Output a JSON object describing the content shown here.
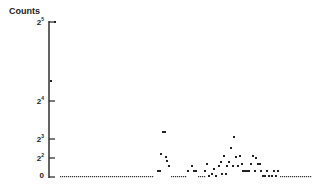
{
  "chart_data": {
    "type": "scatter",
    "title": "",
    "xlabel": "",
    "ylabel": "Counts",
    "yscale": "log2-like (0, 2^2, 2^3, 2^4, 2^5)",
    "ylim": [
      0,
      32
    ],
    "yticks": [
      {
        "label": "0",
        "base": "0",
        "exp": "",
        "value": 0,
        "py": 177
      },
      {
        "label": "2^2",
        "base": "2",
        "exp": "2",
        "value": 4,
        "py": 158
      },
      {
        "label": "2^3",
        "base": "2",
        "exp": "3",
        "value": 8,
        "py": 139
      },
      {
        "label": "2^4",
        "base": "2",
        "exp": "4",
        "value": 16,
        "py": 101
      },
      {
        "label": "2^5",
        "base": "2",
        "exp": "5",
        "value": 32,
        "py": 22
      }
    ],
    "grid": false,
    "legend": null,
    "points_px": [
      [
        55,
        22
      ],
      [
        51,
        81
      ],
      [
        158,
        171
      ],
      [
        160,
        171
      ],
      [
        161,
        154
      ],
      [
        163,
        132
      ],
      [
        165,
        132
      ],
      [
        166,
        157
      ],
      [
        167,
        161
      ],
      [
        169,
        166
      ],
      [
        188,
        171
      ],
      [
        192,
        166
      ],
      [
        194,
        171
      ],
      [
        196,
        171
      ],
      [
        205,
        171
      ],
      [
        207,
        164
      ],
      [
        209,
        176
      ],
      [
        212,
        174
      ],
      [
        214,
        169
      ],
      [
        216,
        176
      ],
      [
        219,
        166
      ],
      [
        221,
        162
      ],
      [
        222,
        174
      ],
      [
        224,
        156
      ],
      [
        226,
        174
      ],
      [
        227,
        166
      ],
      [
        229,
        162
      ],
      [
        231,
        148
      ],
      [
        233,
        166
      ],
      [
        234,
        137
      ],
      [
        236,
        157
      ],
      [
        238,
        166
      ],
      [
        240,
        156
      ],
      [
        242,
        164
      ],
      [
        243,
        171
      ],
      [
        245,
        171
      ],
      [
        247,
        171
      ],
      [
        249,
        171
      ],
      [
        251,
        164
      ],
      [
        253,
        156
      ],
      [
        255,
        171
      ],
      [
        256,
        158
      ],
      [
        258,
        164
      ],
      [
        260,
        164
      ],
      [
        261,
        171
      ],
      [
        263,
        176
      ],
      [
        265,
        176
      ],
      [
        267,
        171
      ],
      [
        269,
        176
      ],
      [
        272,
        176
      ],
      [
        274,
        171
      ],
      [
        276,
        176
      ],
      [
        278,
        171
      ]
    ],
    "zero_runs": [
      {
        "x_start": 60,
        "x_end": 153,
        "py": 177
      },
      {
        "x_start": 171,
        "x_end": 186,
        "py": 177
      },
      {
        "x_start": 198,
        "x_end": 204,
        "py": 177
      },
      {
        "x_start": 280,
        "x_end": 310,
        "py": 177
      }
    ]
  }
}
